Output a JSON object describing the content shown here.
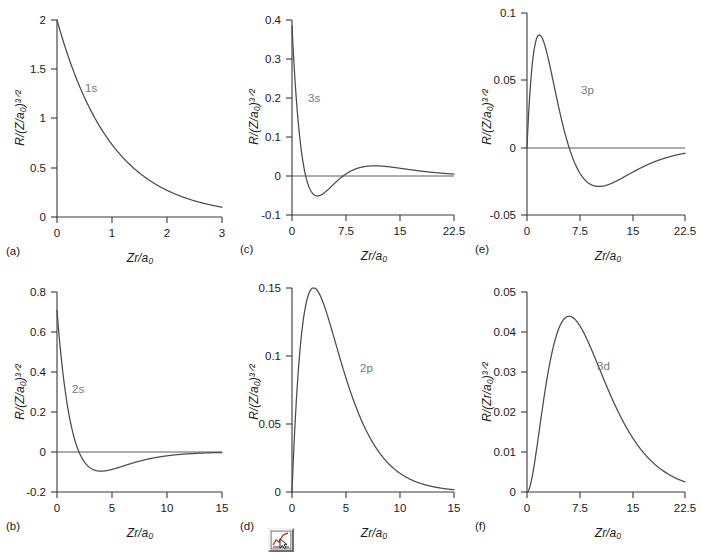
{
  "figure": {
    "caption_letters": [
      "(a)",
      "(b)",
      "(c)",
      "(d)",
      "(e)",
      "(f)"
    ],
    "icon": {
      "name": "chart-icon",
      "tooltip": "chart"
    }
  },
  "chart_data": [
    {
      "id": "panel-a",
      "letter": "(a)",
      "type": "line",
      "title": "",
      "series_label": "1s",
      "xlabel": "Zr/a0",
      "ylabel": "R/(Z/a0)3/2",
      "ylabel_display": "R/(Z/a₀)³ᐟ²",
      "xlabel_display": "Zr/a₀",
      "xlim": [
        0,
        3
      ],
      "ylim": [
        0,
        2
      ],
      "xticks": [
        "0",
        "1",
        "2",
        "3"
      ],
      "xtick_values": [
        0,
        1,
        2,
        3
      ],
      "yticks": [
        "0",
        "0.5",
        "1",
        "1.5",
        "2"
      ],
      "ytick_values": [
        0,
        0.5,
        1,
        1.5,
        2
      ],
      "grid": false,
      "zero_line": false,
      "formula": "2*exp(-r)",
      "key_points": [
        {
          "x": 0,
          "y": 2.0
        },
        {
          "x": 0.5,
          "y": 1.213
        },
        {
          "x": 1.0,
          "y": 0.736
        },
        {
          "x": 1.5,
          "y": 0.446
        },
        {
          "x": 2.0,
          "y": 0.271
        },
        {
          "x": 2.5,
          "y": 0.164
        },
        {
          "x": 3.0,
          "y": 0.0996
        }
      ]
    },
    {
      "id": "panel-b",
      "letter": "(b)",
      "type": "line",
      "title": "",
      "series_label": "2s",
      "xlabel": "Zr/a0",
      "ylabel": "R/(Z/a0)3/2",
      "ylabel_display": "R/(Z/a₀)³ᐟ²",
      "xlabel_display": "Zr/a₀",
      "xlim": [
        0,
        15
      ],
      "ylim": [
        -0.2,
        0.8
      ],
      "xticks": [
        "0",
        "5",
        "10",
        "15"
      ],
      "xtick_values": [
        0,
        5,
        10,
        15
      ],
      "yticks": [
        "-0.2",
        "0",
        "0.2",
        "0.4",
        "0.6",
        "0.8"
      ],
      "ytick_values": [
        -0.2,
        0,
        0.2,
        0.4,
        0.6,
        0.8
      ],
      "grid": false,
      "zero_line": true,
      "formula": "(1/(2*sqrt(2)))*(2-r)*exp(-r/2)",
      "node_x": 2.0,
      "key_points": [
        {
          "x": 0,
          "y": 0.7071
        },
        {
          "x": 1,
          "y": 0.2144
        },
        {
          "x": 2,
          "y": 0.0
        },
        {
          "x": 3,
          "y": -0.0789
        },
        {
          "x": 4,
          "y": -0.0957
        },
        {
          "x": 5,
          "y": -0.0871
        },
        {
          "x": 7,
          "y": -0.0536
        },
        {
          "x": 10,
          "y": -0.0204
        },
        {
          "x": 15,
          "y": -0.0027
        }
      ]
    },
    {
      "id": "panel-c",
      "letter": "(c)",
      "type": "line",
      "title": "",
      "series_label": "3s",
      "xlabel": "Zr/a0",
      "ylabel": "R/(Z/a0)3/2",
      "ylabel_display": "R/(Z/a₀)³ᐟ²",
      "xlabel_display": "Zr/a₀",
      "xlim": [
        0,
        22.5
      ],
      "ylim": [
        -0.1,
        0.4
      ],
      "xticks": [
        "0",
        "7.5",
        "15",
        "22.5"
      ],
      "xtick_values": [
        0,
        7.5,
        15,
        22.5
      ],
      "yticks": [
        "-0.1",
        "0",
        "0.1",
        "0.2",
        "0.3",
        "0.4"
      ],
      "ytick_values": [
        -0.1,
        0,
        0.1,
        0.2,
        0.3,
        0.4
      ],
      "grid": false,
      "zero_line": true,
      "formula": "(2/(81*sqrt(3)))*(27-18*r+2*r*r)*exp(-r/3)",
      "key_points": [
        {
          "x": 0,
          "y": 0.385
        },
        {
          "x": 1,
          "y": 0.0815
        },
        {
          "x": 1.9,
          "y": 0.0
        },
        {
          "x": 4,
          "y": -0.0505
        },
        {
          "x": 7.1,
          "y": 0.0
        },
        {
          "x": 11,
          "y": 0.0258
        },
        {
          "x": 15,
          "y": 0.0198
        },
        {
          "x": 22.5,
          "y": 0.0065
        }
      ]
    },
    {
      "id": "panel-d",
      "letter": "(d)",
      "type": "line",
      "title": "",
      "series_label": "2p",
      "xlabel": "Zr/a0",
      "ylabel": "R/(Z/a0)3/2",
      "ylabel_display": "R/(Z/a₀)³ᐟ²",
      "xlabel_display": "Zr/a₀",
      "xlim": [
        0,
        15
      ],
      "ylim": [
        0,
        0.15
      ],
      "xticks": [
        "0",
        "5",
        "10",
        "15"
      ],
      "xtick_values": [
        0,
        5,
        10,
        15
      ],
      "yticks": [
        "0",
        "0.05",
        "0.1",
        "0.15"
      ],
      "ytick_values": [
        0,
        0.05,
        0.1,
        0.15
      ],
      "grid": false,
      "zero_line": false,
      "formula": "(1/(2*sqrt(6)))*r*exp(-r/2)",
      "peak": {
        "x": 2.0,
        "y": 0.1502
      },
      "key_points": [
        {
          "x": 0,
          "y": 0.0
        },
        {
          "x": 1,
          "y": 0.1238
        },
        {
          "x": 2,
          "y": 0.1502
        },
        {
          "x": 4,
          "y": 0.1105
        },
        {
          "x": 6,
          "y": 0.061
        },
        {
          "x": 10,
          "y": 0.0138
        },
        {
          "x": 15,
          "y": 0.0017
        }
      ]
    },
    {
      "id": "panel-e",
      "letter": "(e)",
      "type": "line",
      "title": "",
      "series_label": "3p",
      "xlabel": "Zr/a0",
      "ylabel": "R/(Z/a0)3/2",
      "ylabel_display": "R/(Z/a₀)³ᐟ²",
      "xlabel_display": "Zr/a₀",
      "xlim": [
        0,
        22.5
      ],
      "ylim": [
        -0.05,
        0.1
      ],
      "xticks": [
        "0",
        "7.5",
        "15",
        "22.5"
      ],
      "xtick_values": [
        0,
        7.5,
        15,
        22.5
      ],
      "yticks": [
        "-0.05",
        "0",
        "0.05",
        "0.1"
      ],
      "ytick_values": [
        -0.05,
        0,
        0.05,
        0.1
      ],
      "grid": false,
      "zero_line": true,
      "formula": "(4/(81*sqrt(6)))*(6*r-r*r)*exp(-r/3)",
      "peak": {
        "x": 2.0,
        "y": 0.0772
      },
      "node_x": 6.0,
      "key_points": [
        {
          "x": 0,
          "y": 0.0
        },
        {
          "x": 2,
          "y": 0.0772
        },
        {
          "x": 4,
          "y": 0.0637
        },
        {
          "x": 6,
          "y": 0.0
        },
        {
          "x": 9.5,
          "y": -0.0233
        },
        {
          "x": 15,
          "y": -0.0122
        },
        {
          "x": 22.5,
          "y": -0.0022
        }
      ]
    },
    {
      "id": "panel-f",
      "letter": "(f)",
      "type": "line",
      "title": "",
      "series_label": "3d",
      "xlabel": "Zr/a0",
      "ylabel": "R/(Zr/a0)3/2",
      "ylabel_display": "R/(Zr/a₀)³ᐟ²",
      "xlabel_display": "Zr/a₀",
      "xlim": [
        0,
        22.5
      ],
      "ylim": [
        0,
        0.05
      ],
      "xticks": [
        "0",
        "7.5",
        "15",
        "22.5"
      ],
      "xtick_values": [
        0,
        7.5,
        15,
        22.5
      ],
      "yticks": [
        "0",
        "0.01",
        "0.02",
        "0.03",
        "0.04",
        "0.05"
      ],
      "ytick_values": [
        0,
        0.01,
        0.02,
        0.03,
        0.04,
        0.05
      ],
      "grid": false,
      "zero_line": false,
      "formula": "(4/(81*sqrt(30)))*r*r*exp(-r/3)",
      "peak": {
        "x": 6.0,
        "y": 0.0445
      },
      "key_points": [
        {
          "x": 0,
          "y": 0.0
        },
        {
          "x": 2,
          "y": 0.0057
        },
        {
          "x": 4,
          "y": 0.0186
        },
        {
          "x": 6,
          "y": 0.0445
        },
        {
          "x": 7.5,
          "y": 0.0443
        },
        {
          "x": 11,
          "y": 0.0347
        },
        {
          "x": 15,
          "y": 0.0201
        },
        {
          "x": 22.5,
          "y": 0.0027
        }
      ]
    }
  ]
}
